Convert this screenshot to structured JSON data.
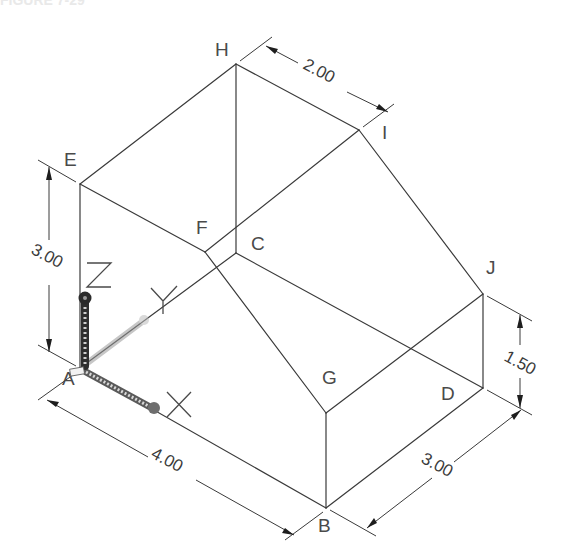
{
  "figure": {
    "heading": "FIGURE 7-29",
    "vertices": [
      {
        "id": "A",
        "label": "A",
        "label_x": 62,
        "label_y": 385
      },
      {
        "id": "B",
        "label": "B",
        "label_x": 318,
        "label_y": 532
      },
      {
        "id": "C",
        "label": "C",
        "label_x": 251,
        "label_y": 250
      },
      {
        "id": "D",
        "label": "D",
        "label_x": 441,
        "label_y": 400
      },
      {
        "id": "E",
        "label": "E",
        "label_x": 64,
        "label_y": 166
      },
      {
        "id": "F",
        "label": "F",
        "label_x": 196,
        "label_y": 234
      },
      {
        "id": "G",
        "label": "G",
        "label_x": 322,
        "label_y": 384
      },
      {
        "id": "H",
        "label": "H",
        "label_x": 215,
        "label_y": 56
      },
      {
        "id": "I",
        "label": "I",
        "label_x": 382,
        "label_y": 139
      },
      {
        "id": "J",
        "label": "J",
        "label_x": 486,
        "label_y": 274
      }
    ],
    "dimensions": [
      {
        "id": "dim-top",
        "text": "2.00",
        "from": "H",
        "to": "I"
      },
      {
        "id": "dim-left",
        "text": "3.00",
        "from": "A",
        "to": "E"
      },
      {
        "id": "dim-bottom",
        "text": "4.00",
        "from": "A",
        "to": "B"
      },
      {
        "id": "dim-right-bottom",
        "text": "3.00",
        "from": "B",
        "to": "D"
      },
      {
        "id": "dim-right",
        "text": "1.50",
        "from": "D",
        "to": "J"
      }
    ],
    "ucs_icon": {
      "axes": [
        "X",
        "Y",
        "Z"
      ]
    }
  }
}
